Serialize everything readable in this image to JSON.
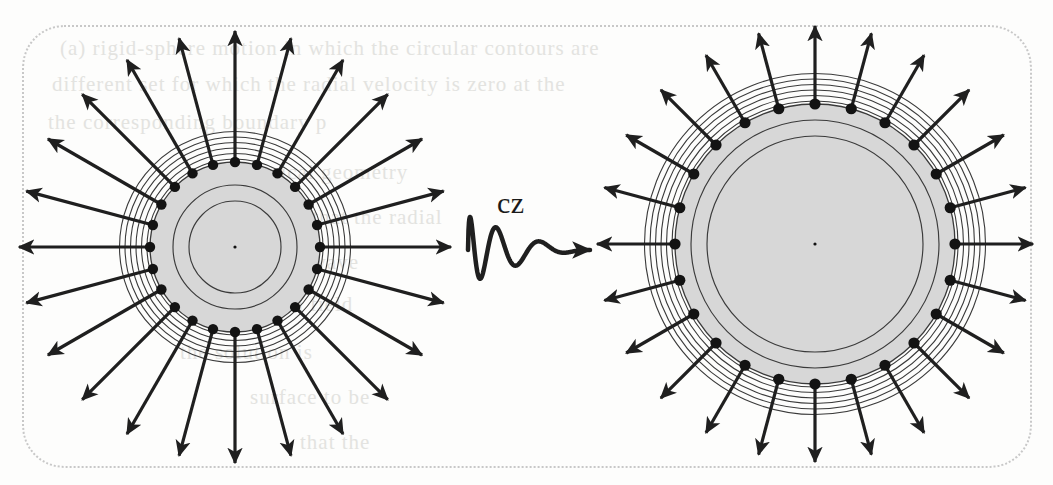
{
  "figure": {
    "caption_label": "cz",
    "background_color": "#fdfdfc",
    "frame": {
      "style": "dotted",
      "color": "#c8c8c8",
      "corner_radius": 42
    },
    "bleed_through_text": [
      {
        "text": "(a) rigid-sphere motion in which the circular contours are",
        "x": 60,
        "y": 36
      },
      {
        "text": "different set for which the radial velocity is zero at the",
        "x": 52,
        "y": 72
      },
      {
        "text": "the corresponding boundary p",
        "x": 48,
        "y": 110
      },
      {
        "text": "spherical geometry",
        "x": 230,
        "y": 160
      },
      {
        "text": "is that the radial",
        "x": 290,
        "y": 205
      },
      {
        "text": "of the wave",
        "x": 250,
        "y": 250
      },
      {
        "text": "radiation field",
        "x": 220,
        "y": 292
      },
      {
        "text": "the solution is",
        "x": 180,
        "y": 340
      },
      {
        "text": "surface to be",
        "x": 250,
        "y": 385
      },
      {
        "text": "that the",
        "x": 300,
        "y": 430
      }
    ]
  },
  "objects": [
    {
      "id": "left-emitter",
      "name": "small-radiating-sphere",
      "center": {
        "x": 235,
        "y": 247
      },
      "core_radius": 85,
      "inner_circle_radii": [
        46,
        62
      ],
      "center_dot_radius": 1.6,
      "ring_count": 6,
      "ring_inner_radius": 88,
      "ring_spacing": 5.5,
      "node_count": 24,
      "node_radius": 5.2,
      "arrow_start_radius": 85,
      "arrow_tip_radius": 216,
      "fill_color": "#d7d7d7",
      "stroke_color": "#3a3a3a",
      "arrow_color": "#1f1f1f"
    },
    {
      "id": "right-emitter",
      "name": "large-radiating-sphere",
      "center": {
        "x": 815,
        "y": 244
      },
      "core_radius": 140,
      "inner_circle_radii": [
        108,
        124
      ],
      "center_dot_radius": 1.6,
      "ring_count": 6,
      "ring_inner_radius": 143,
      "ring_spacing": 5.5,
      "node_count": 24,
      "node_radius": 5.6,
      "arrow_start_radius": 140,
      "arrow_tip_radius": 218,
      "fill_color": "#d7d7d7",
      "stroke_color": "#3a3a3a",
      "arrow_color": "#1f1f1f"
    }
  ],
  "connector": {
    "name": "damped-wave-arrow",
    "label": "cz",
    "label_position": {
      "x": 497,
      "y": 186
    },
    "start": {
      "x": 468,
      "y": 250
    },
    "end": {
      "x": 590,
      "y": 248
    },
    "waveform": "damped-sinusoid",
    "color": "#1f1f1f",
    "stroke_width": 4.5
  }
}
